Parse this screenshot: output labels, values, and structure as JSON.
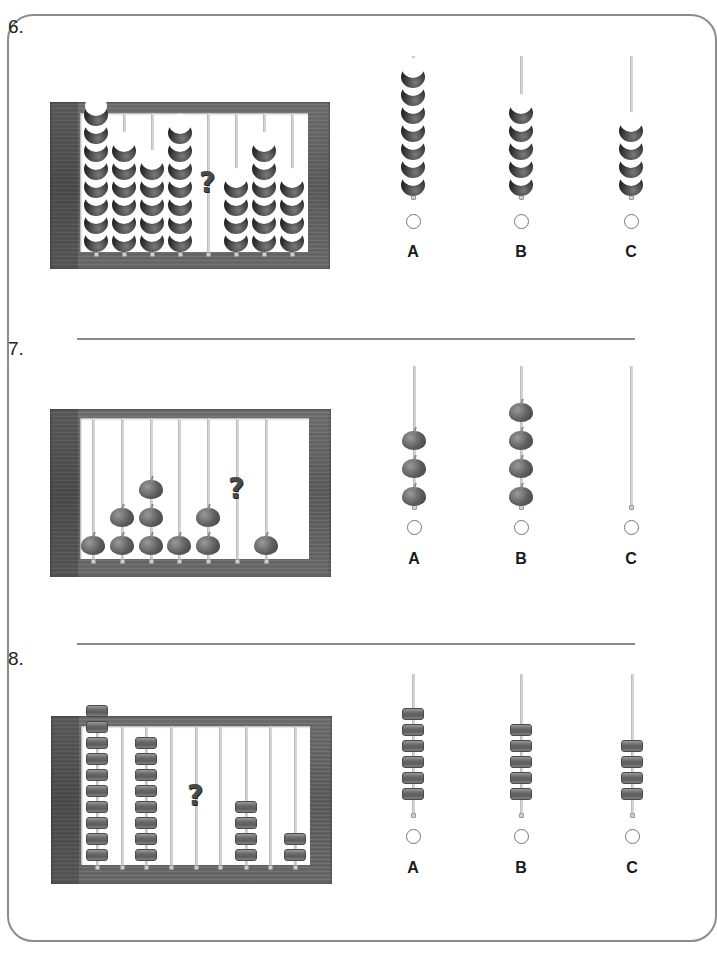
{
  "problems": [
    {
      "number": "6.",
      "number_pos": [
        8,
        16
      ],
      "bead_type": "moon",
      "frame": {
        "x": 50,
        "y": 102,
        "w": 280,
        "h": 167,
        "win": {
          "x": 80,
          "y": 113,
          "w": 228,
          "h": 139
        }
      },
      "abacus": {
        "rods_x": [
          96,
          124,
          152,
          180,
          208,
          236,
          264,
          292
        ],
        "counts": [
          8,
          6,
          5,
          7,
          null,
          4,
          6,
          4
        ],
        "question_rod": 4,
        "question_mark": "?"
      },
      "options": [
        {
          "label": "A",
          "count": 7,
          "x": 413
        },
        {
          "label": "B",
          "count": 5,
          "x": 521
        },
        {
          "label": "C",
          "count": 4,
          "x": 631
        }
      ],
      "options_layout": {
        "rod_top": 56,
        "rod_bottom": 198,
        "bead_bottom": 192,
        "radio_y": 214,
        "label_y": 243
      }
    },
    {
      "number": "7.",
      "number_pos": [
        8,
        338
      ],
      "bead_type": "apple",
      "frame": {
        "x": 50,
        "y": 409,
        "w": 281,
        "h": 168,
        "win": {
          "x": 80,
          "y": 418,
          "w": 229,
          "h": 141
        }
      },
      "abacus": {
        "rods_x": [
          93,
          122,
          151,
          179,
          208,
          237,
          266
        ],
        "counts": [
          1,
          2,
          3,
          1,
          2,
          null,
          1
        ],
        "question_rod": 5,
        "question_mark": "?"
      },
      "options": [
        {
          "label": "A",
          "count": 3,
          "x": 414
        },
        {
          "label": "B",
          "count": 4,
          "x": 521
        },
        {
          "label": "C",
          "count": 0,
          "x": 631
        }
      ],
      "options_layout": {
        "rod_top": 366,
        "rod_bottom": 508,
        "bead_bottom": 506,
        "radio_y": 520,
        "label_y": 550
      }
    },
    {
      "number": "8.",
      "number_pos": [
        8,
        648
      ],
      "bead_type": "drum",
      "frame": {
        "x": 51,
        "y": 716,
        "w": 281,
        "h": 168,
        "win": {
          "x": 81,
          "y": 726,
          "w": 229,
          "h": 139
        }
      },
      "abacus": {
        "rods_x": [
          97,
          122,
          146,
          171,
          196,
          220,
          246,
          270,
          295
        ],
        "counts": [
          10,
          0,
          8,
          0,
          null,
          0,
          4,
          0,
          2
        ],
        "question_rod": 4,
        "question_mark": "?"
      },
      "options": [
        {
          "label": "A",
          "count": 6,
          "x": 413
        },
        {
          "label": "B",
          "count": 5,
          "x": 521
        },
        {
          "label": "C",
          "count": 4,
          "x": 632
        }
      ],
      "options_layout": {
        "rod_top": 674,
        "rod_bottom": 816,
        "bead_bottom": 800,
        "radio_y": 829,
        "label_y": 859
      }
    }
  ],
  "dividers": [
    {
      "x1": 77,
      "x2": 635,
      "y": 338
    },
    {
      "x1": 77,
      "x2": 635,
      "y": 643
    }
  ]
}
